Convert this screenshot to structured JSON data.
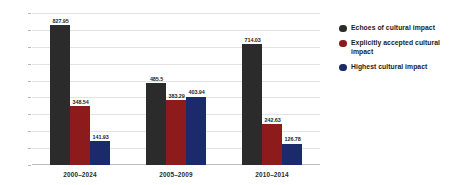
{
  "chart_data": {
    "type": "bar",
    "title": "",
    "subtitle": "",
    "xlabel": "",
    "ylabel": "",
    "ylim": [
      0,
      900
    ],
    "ytick_step": 100,
    "yticks": [
      "900",
      "800",
      "700",
      "600",
      "500",
      "400",
      "300",
      "200",
      "100",
      "0"
    ],
    "grid": true,
    "legend_position": "right",
    "categories": [
      "2000–2024",
      "2005–2009",
      "2010–2014"
    ],
    "series": [
      {
        "name": "Echoes of cultural impact",
        "color": "#2b2b2b",
        "values": [
          827.95,
          485.5,
          714.03
        ],
        "labels": [
          "827.95",
          "485.5",
          "714.03"
        ]
      },
      {
        "name": "Explicitly accepted cultural impact",
        "color": "#8e1b1b",
        "values": [
          348.54,
          383.29,
          242.63
        ],
        "labels": [
          "348.54",
          "383.29",
          "242.63"
        ]
      },
      {
        "name": "Highest cultural impact",
        "color": "#1b2a6b",
        "values": [
          141.93,
          403.94,
          126.78
        ],
        "labels": [
          "141.93",
          "403.94",
          "126.78"
        ]
      }
    ]
  },
  "legend": {
    "items": [
      {
        "label": "Echoes of cultural impact",
        "color": "#2b2b2b"
      },
      {
        "label": "Explicitly accepted cultural impact",
        "color": "#8e1b1b"
      },
      {
        "label": "Highest cultural impact",
        "color": "#1b2a6b"
      }
    ]
  },
  "colors": {
    "background": "#ffffff",
    "gridline": "#e3e3e3",
    "axis": "#bdbdbd",
    "tick_text": "#3a3a3a",
    "value_text": "#1d1d2e"
  }
}
